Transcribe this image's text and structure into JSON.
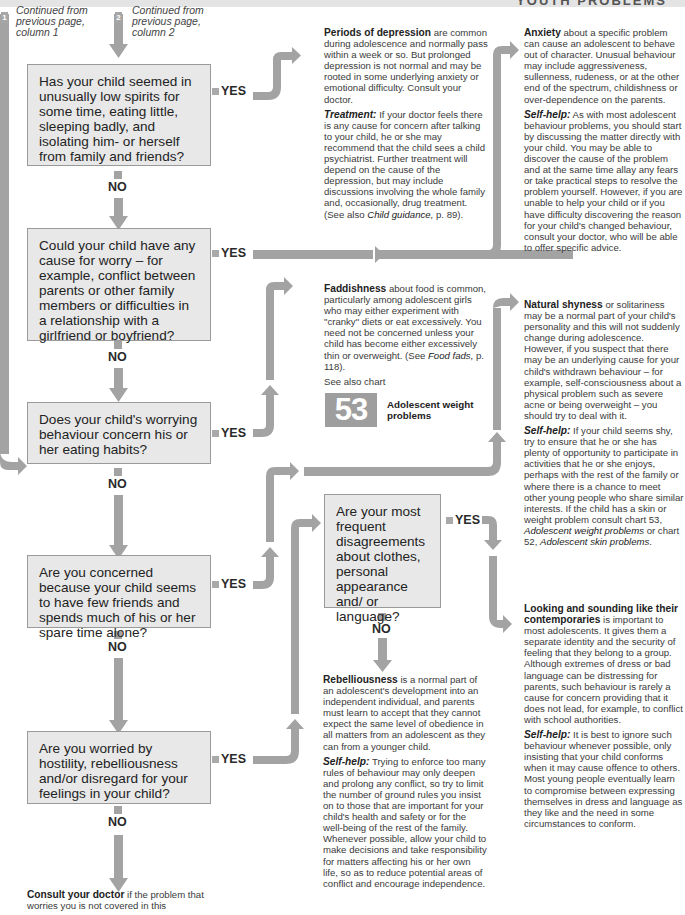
{
  "header": {
    "title": "YOUTH PROBLEMS"
  },
  "continuations": [
    {
      "badge": "1",
      "text": "Continued from previous page, column 1"
    },
    {
      "badge": "2",
      "text": "Continued from previous page, column 2"
    }
  ],
  "labels": {
    "yes": "YES",
    "no": "NO"
  },
  "questions": [
    {
      "text": "Has your child seemed in unusually low spirits for some time, eating little, sleeping badly, and isolating him- or herself from family and friends?"
    },
    {
      "text": "Could your child have any cause for worry – for example, conflict between parents or other family members or difficulties in a relationship with a girlfriend or boyfriend?"
    },
    {
      "text": "Does your child's worrying behaviour concern his or her eating habits?"
    },
    {
      "text": "Are you concerned because your child seems to have few friends and spends much of his or her spare time alone?"
    },
    {
      "text": "Are you worried by hostility, rebelliousness and/or disregard for your feelings in your child?"
    },
    {
      "text": "Are your most frequent disagreements about clothes, personal appearance and/ or language?"
    }
  ],
  "outcomes": {
    "depression": {
      "title": "Periods of depression",
      "body": " are common during adolescence and normally pass within a week or so. But prolonged depression is not normal and may be rooted in some underlying anxiety or emotional difficulty. Consult your doctor.",
      "treatment_label": "Treatment:",
      "treatment_body": " If your doctor feels there is any cause for concern after talking to your child, he or she may recommend that the child sees a child psychiatrist. Further treatment will depend on the cause of the depression, but may include discussions involving the whole family and, occasionally, drug treatment. (See also ",
      "treatment_ref": "Child guidance,",
      "treatment_end": " p. 89)."
    },
    "anxiety": {
      "title": "Anxiety",
      "body": " about a specific problem can cause an adolescent to behave out of character. Unusual behaviour may include aggressiveness, sullenness, rudeness, or at the other end of the spectrum, childishness or over-dependence on the parents.",
      "selfhelp_label": "Self-help:",
      "selfhelp_body": " As with most adolescent behaviour problems, you should start by discussing the matter directly with your child. You may be able to discover the cause of the problem and at the same time allay any fears or take practical steps to resolve the problem yourself. However, if you are unable to help your child or if you have difficulty discovering the reason for your child's changed behaviour, consult your doctor, who will be able to offer specific advice."
    },
    "faddishness": {
      "title": "Faddishness",
      "body": " about food is common, particularly among adolescent girls who may either experiment with \"cranky\" diets or eat excessively. You need not be concerned unless your child has become either excessively thin or overweight. (See ",
      "ref": "Food fads,",
      "end": " p. 118).",
      "see_also": "See also chart",
      "chart_number": "53",
      "chart_title": "Adolescent weight problems"
    },
    "shyness": {
      "title": "Natural shyness",
      "body": " or solitariness may be a normal part of your child's personality and this will not suddenly change during adolescence. However, if you suspect that there may be an underlying cause for your child's withdrawn behaviour – for example, self-consciousness about a physical problem such as severe acne or being overweight – you should try to deal with it.",
      "selfhelp_label": "Self-help:",
      "selfhelp_body": " If your child seems shy, try to ensure that he or she has plenty of opportunity to participate in activities that he or she enjoys, perhaps with the rest of the family or where there is a chance to meet other young people who share similar interests. If the child has a skin or weight problem consult chart 53, ",
      "ref1": "Adolescent weight problems",
      "mid": " or chart 52, ",
      "ref2": "Adolescent skin problems",
      "end": "."
    },
    "contemporaries": {
      "title": "Looking and sounding like their contemporaries",
      "body": " is important to most adolescents. It gives them a separate identity and the security of feeling that they belong to a group. Although extremes of dress or bad language can be distressing for parents, such behaviour is rarely a cause for concern providing that it does not lead, for example, to conflict with school authorities.",
      "selfhelp_label": "Self-help:",
      "selfhelp_body": " It is best to ignore such behaviour whenever possible, only insisting that your child conforms when it may cause offence to others. Most young people eventually learn to compromise between expressing themselves in dress and language as they like and the need in some circumstances to conform."
    },
    "rebelliousness": {
      "title": "Rebelliousness",
      "body": " is a normal part of an adolescent's development into an independent individual, and parents must learn to accept that they cannot expect the same level of obedience in all matters from an adolescent as they can from a younger child.",
      "selfhelp_label": "Self-help:",
      "selfhelp_body": " Trying to enforce too many rules of behaviour may only deepen and prolong any conflict, so try to limit the number of ground rules you insist on to those that are important for your child's health and safety or for the well-being of the rest of the family. Whenever possible, allow your child to make decisions and take responsibility for matters affecting his or her own life, so as to reduce potential areas of conflict and encourage independence."
    },
    "consult": {
      "title": "Consult your doctor",
      "body": " if the problem that worries you is not covered in this"
    }
  },
  "colors": {
    "arrow": "#a3a3a3",
    "box_fill": "#e8e8e8",
    "box_border": "#9a9a9a",
    "chart_badge": "#9e9e9e"
  }
}
